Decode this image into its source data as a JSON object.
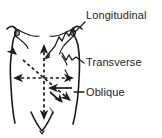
{
  "figure": {
    "background_color": "#ffffff",
    "line_color": "#1a1a1a",
    "text_color": "#1e1e1e"
  },
  "labels": [
    {
      "id": "longitudinal",
      "text": "Longitudinal",
      "x": 86,
      "y": 19,
      "leader": "diagonal-zigzag-from-upper-right-to-lower-left"
    },
    {
      "id": "transverse",
      "text": "Transverse",
      "x": 86,
      "y": 65,
      "leader": "short-hook-left"
    },
    {
      "id": "oblique",
      "text": "Oblique",
      "x": 86,
      "y": 95,
      "leader": "short-dash-left"
    }
  ],
  "axes": {
    "center": {
      "x": 44,
      "y": 78
    },
    "items": [
      {
        "id": "vertical",
        "plane": "longitudinal",
        "style": "dashed",
        "x1": 44,
        "y1": 46,
        "x2": 44,
        "y2": 118,
        "double_headed": true
      },
      {
        "id": "horizontal",
        "plane": "transverse",
        "style": "dashed",
        "x1": 15,
        "y1": 78,
        "x2": 72,
        "y2": 78,
        "double_headed": true
      },
      {
        "id": "diagonal-nw-se",
        "plane": "oblique",
        "style": "dashed",
        "x1": 17,
        "y1": 55,
        "x2": 71,
        "y2": 101,
        "double_headed": true
      },
      {
        "id": "diagonal-ne-sw",
        "plane": "oblique",
        "style": "solid",
        "x1": 77,
        "y1": 48,
        "x2": 57,
        "y2": 66,
        "double_headed": false
      }
    ]
  },
  "anatomy": {
    "parts": [
      {
        "id": "left-breast",
        "nipple_x": 17,
        "nipple_y": 33
      },
      {
        "id": "right-breast",
        "nipple_x": 73,
        "nipple_y": 33
      },
      {
        "id": "left-torso-contour"
      },
      {
        "id": "right-torso-contour"
      },
      {
        "id": "pubic-v",
        "x": 42,
        "y": 128
      }
    ]
  }
}
